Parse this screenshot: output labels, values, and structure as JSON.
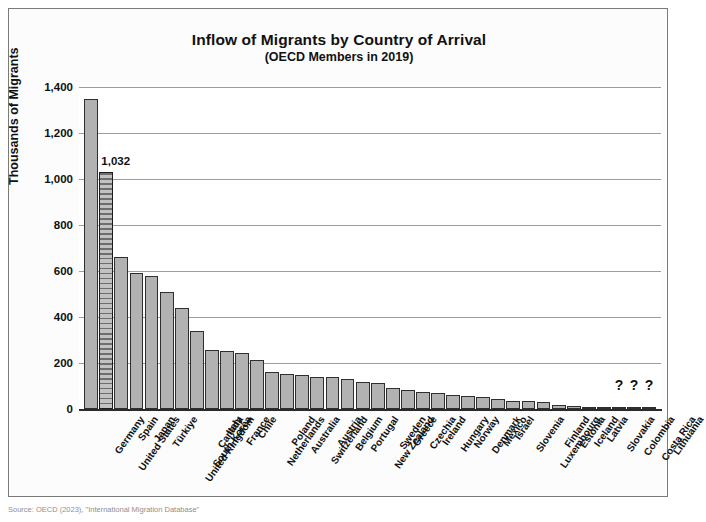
{
  "chart_data": {
    "type": "bar",
    "title": "Inflow of Migrants by Country of Arrival",
    "subtitle": "(OECD Members in 2019)",
    "xlabel": "",
    "ylabel": "Thousands of Migrants",
    "ylim": [
      0,
      1400
    ],
    "yticks": [
      0,
      200,
      400,
      600,
      800,
      1000,
      1200,
      1400
    ],
    "ytick_labels": [
      "0",
      "200",
      "400",
      "600",
      "800",
      "1,000",
      "1,200",
      "1,400"
    ],
    "grid": true,
    "legend": null,
    "categories": [
      "Germany",
      "United States",
      "Spain",
      "Japan",
      "Türkiye",
      "United Kingdom",
      "South Korea",
      "Canada",
      "Italy",
      "France",
      "Chile",
      "Netherlands",
      "Poland",
      "Australia",
      "Switzerland",
      "Austria",
      "Belgium",
      "Portugal",
      "New Zealand",
      "Sweden",
      "Greece",
      "Czechia",
      "Ireland",
      "Hungary",
      "Norway",
      "Denmark",
      "Mexico",
      "Israel",
      "Slovenia",
      "Luxembourg",
      "Finland",
      "Estonia",
      "Iceland",
      "Latvia",
      "Slovakia",
      "Colombia",
      "Costa Rica",
      "Lithuania"
    ],
    "values": [
      1347,
      1032,
      660,
      593,
      578,
      507,
      439,
      341,
      258,
      253,
      243,
      212,
      160,
      154,
      146,
      141,
      138,
      131,
      119,
      115,
      90,
      83,
      75,
      70,
      60,
      56,
      51,
      45,
      36,
      33,
      32,
      18,
      12,
      8,
      6,
      5,
      4,
      3
    ],
    "annotations": [
      {
        "label": "1,032",
        "category": "United States"
      },
      {
        "label": "?",
        "category": "Colombia"
      },
      {
        "label": "?",
        "category": "Costa Rica"
      },
      {
        "label": "?",
        "category": "Lithuania"
      }
    ],
    "highlighted_category": "United States"
  },
  "colors": {
    "bar_fill": "#b2b2b2",
    "bar_edge": "#2f2f2f",
    "highlight_fill": "#9a9a9a",
    "gridline": "#9d9d9d",
    "axis": "#2b2b2b",
    "text": "#111111",
    "frame_border": "#7a7a7a"
  },
  "source": {
    "text": "Source: OECD (2023), \"International Migration Database\""
  }
}
